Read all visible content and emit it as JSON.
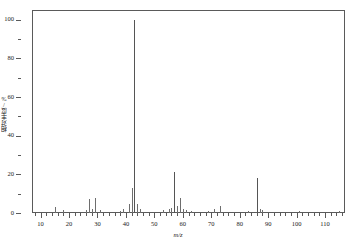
{
  "chart_data": {
    "type": "bar",
    "title": "",
    "xlabel": "m/z",
    "ylabel": "相对丰度/%",
    "xlim": [
      7,
      117
    ],
    "ylim": [
      0,
      105
    ],
    "grid": false,
    "legend": "none",
    "x_major_ticks": [
      10,
      20,
      30,
      40,
      50,
      60,
      70,
      80,
      90,
      100,
      110
    ],
    "x_tick_labels": [
      "10",
      "20",
      "30",
      "40",
      "50",
      "60",
      "70",
      "80",
      "90",
      "100",
      "110"
    ],
    "x_minor_tick_step": 2,
    "y_major_ticks": [
      0,
      20,
      40,
      60,
      80,
      100
    ],
    "y_tick_labels": [
      "0",
      "20",
      "40",
      "60",
      "80",
      "100"
    ],
    "y_minor_ticks": [
      10,
      30,
      50,
      70,
      90
    ],
    "categories": [
      15,
      18,
      26,
      27,
      28,
      29,
      31,
      38,
      39,
      41,
      42,
      43,
      44,
      45,
      53,
      55,
      56,
      57,
      58,
      59,
      60,
      61,
      63,
      69,
      71,
      73,
      83,
      86,
      87,
      88,
      101,
      115
    ],
    "values": [
      3,
      1.5,
      1.5,
      7,
      2,
      8,
      1.5,
      1,
      2,
      4.5,
      13,
      100,
      4.5,
      2,
      1.5,
      2,
      2.5,
      21,
      3.5,
      8,
      2,
      1.5,
      1,
      1,
      2,
      3.5,
      1,
      18,
      2,
      1.5,
      1,
      1
    ],
    "base_peak_mz": 43,
    "base_peak_value": 100
  },
  "axes": {
    "y_title": "相对丰度/%",
    "x_title": "m/z"
  },
  "caption": ""
}
